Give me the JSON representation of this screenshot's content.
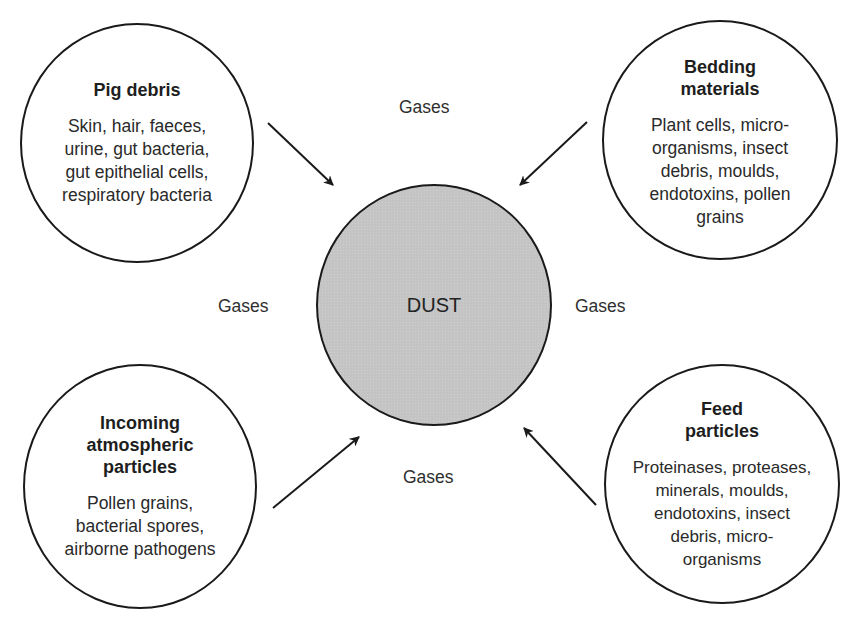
{
  "center": {
    "label": "DUST",
    "fill": "#c4c4c4"
  },
  "sources": [
    {
      "id": "pig-debris",
      "title": [
        "Pig debris"
      ],
      "items": [
        "Skin, hair, faeces,",
        "urine, gut bacteria,",
        "gut epithelial cells,",
        "respiratory bacteria"
      ]
    },
    {
      "id": "bedding-materials",
      "title": [
        "Bedding",
        "materials"
      ],
      "items": [
        "Plant cells, micro-",
        "organisms, insect",
        "debris, moulds,",
        "endotoxins, pollen",
        "grains"
      ]
    },
    {
      "id": "incoming-atmospheric-particles",
      "title": [
        "Incoming",
        "atmospheric",
        "particles"
      ],
      "items": [
        "Pollen grains,",
        "bacterial spores,",
        "airborne pathogens"
      ]
    },
    {
      "id": "feed-particles",
      "title": [
        "Feed",
        "particles"
      ],
      "items": [
        "Proteinases, proteases,",
        "minerals, moulds,",
        "endotoxins, insect",
        "debris, micro-",
        "organisms"
      ]
    }
  ],
  "gases": {
    "top": "Gases",
    "left": "Gases",
    "right": "Gases",
    "bottom": "Gases"
  },
  "colors": {
    "stroke": "#1a1a1a",
    "text": "#2a2a2a",
    "background": "#ffffff"
  }
}
